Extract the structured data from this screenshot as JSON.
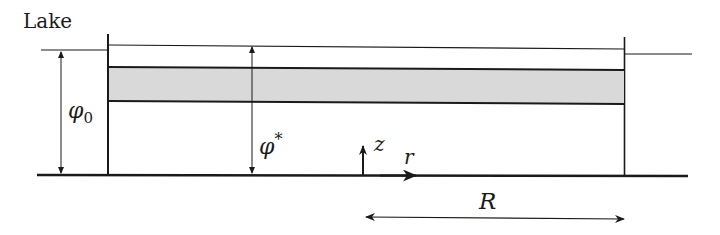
{
  "diagram": {
    "labels": {
      "lake": "Lake",
      "phi0_symbol": "φ",
      "phi0_sub": "0",
      "phistar_symbol": "φ",
      "phistar_sup": "*",
      "z_axis": "z",
      "r_axis": "r",
      "radius": "R"
    },
    "colors": {
      "line": "#1a1a1a",
      "band_fill": "#d9d9d9",
      "background": "#ffffff"
    }
  }
}
